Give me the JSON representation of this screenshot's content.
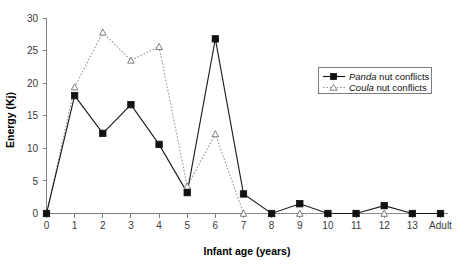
{
  "chart_data": {
    "type": "line",
    "title": "",
    "xlabel": "Infant age (years)",
    "ylabel": "Energy (Kj)",
    "categories": [
      "0",
      "1",
      "2",
      "3",
      "4",
      "5",
      "6",
      "7",
      "8",
      "9",
      "10",
      "11",
      "12",
      "13",
      "Adult"
    ],
    "xtick_labels": [
      "0",
      "1",
      "2",
      "3",
      "4",
      "5",
      "6",
      "7",
      "8",
      "9",
      "10",
      "11",
      "12",
      "13",
      "Adult"
    ],
    "ytick_labels": [
      "0",
      "5",
      "10",
      "15",
      "20",
      "25",
      "30"
    ],
    "ytick_values": [
      0,
      5,
      10,
      15,
      20,
      25,
      30
    ],
    "ylim": [
      0,
      30
    ],
    "grid": false,
    "legend_position": "upper-right-inside",
    "series": [
      {
        "name": "Panda nut conflicts",
        "genus": "Panda",
        "suffix": " nut conflicts",
        "marker": "filled-square",
        "line_style": "solid",
        "color": "#111111",
        "values": [
          0,
          18.1,
          12.3,
          16.7,
          10.6,
          3.2,
          26.8,
          3.0,
          0,
          1.5,
          0,
          0,
          1.2,
          0,
          0
        ]
      },
      {
        "name": "Coula nut conflicts",
        "genus": "Coula",
        "suffix": " nut conflicts",
        "marker": "open-triangle",
        "line_style": "dotted",
        "color": "#9a9a9a",
        "values": [
          0,
          19.4,
          27.8,
          23.5,
          25.6,
          4.2,
          12.2,
          0,
          0,
          0,
          0,
          0,
          0,
          0,
          0
        ]
      }
    ]
  },
  "axes": {
    "y_title": "Energy (Kj)",
    "x_title": "Infant age (years)"
  },
  "legend": {
    "entries": [
      {
        "genus": "Panda",
        "rest": " nut conflicts"
      },
      {
        "genus": "Coula",
        "rest": " nut conflicts"
      }
    ]
  }
}
